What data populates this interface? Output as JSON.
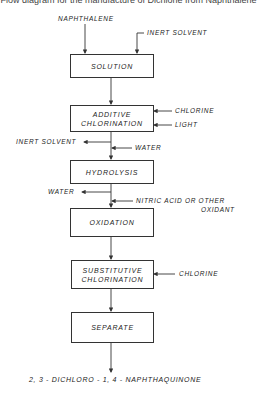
{
  "caption": "Flow diagram for the manufacture of Dichlone from Naphthalene",
  "inputs": {
    "naphthalene": "NAPHTHALENE",
    "inert_solvent_in": "INERT SOLVENT",
    "chlorine_1": "CHLORINE",
    "light": "LIGHT",
    "inert_solvent_out": "INERT SOLVENT",
    "water_in": "WATER",
    "water_out": "WATER",
    "oxidant_line1": "NITRIC ACID OR OTHER",
    "oxidant_line2": "OXIDANT",
    "chlorine_2": "CHLORINE"
  },
  "steps": [
    {
      "line1": "SOLUTION",
      "line2": ""
    },
    {
      "line1": "ADDITIVE",
      "line2": "CHLORINATION"
    },
    {
      "line1": "HYDROLYSIS",
      "line2": ""
    },
    {
      "line1": "OXIDATION",
      "line2": ""
    },
    {
      "line1": "SUBSTITUTIVE",
      "line2": "CHLORINATION"
    },
    {
      "line1": "SEPARATE",
      "line2": ""
    }
  ],
  "product": "2, 3 - DICHLORO - 1, 4 - NAPHTHAQUINONE",
  "colors": {
    "line": "#333333",
    "background": "#ffffff"
  }
}
